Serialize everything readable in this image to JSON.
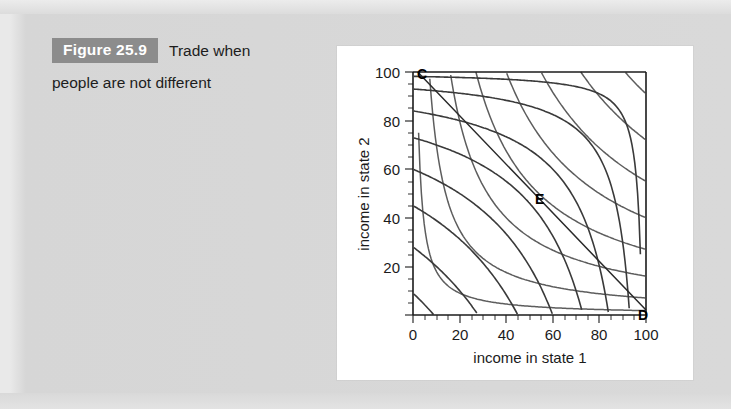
{
  "caption": {
    "figure_badge": "Figure 25.9",
    "title_line1": "Trade when",
    "title_line2": "people are not different",
    "badge_bg": "#8c8c8c",
    "badge_color": "#ffffff"
  },
  "chart_data": {
    "type": "line",
    "title": "",
    "xlabel": "income in state 1",
    "ylabel": "income in state 2",
    "xlim": [
      0,
      105
    ],
    "ylim": [
      0,
      105
    ],
    "xticks": [
      0,
      20,
      40,
      60,
      80,
      100
    ],
    "yticks": [
      20,
      40,
      60,
      80,
      100
    ],
    "xtick_labels": [
      "0",
      "20",
      "40",
      "60",
      "80",
      "100"
    ],
    "ytick_labels": [
      "20",
      "40",
      "60",
      "80",
      "100"
    ],
    "minor_tick_step": 5,
    "grid": false,
    "legend": "none",
    "annotations": [
      {
        "label": "C",
        "x": 2,
        "y": 100,
        "note": "endowment corner top-left"
      },
      {
        "label": "E",
        "x": 50,
        "y": 52,
        "note": "equilibrium / tangency point"
      },
      {
        "label": "D",
        "x": 100,
        "y": 2,
        "note": "endowment corner bottom-right"
      }
    ],
    "series": [
      {
        "name": "person-1 indifference curves",
        "kind": "indifference-family-origin",
        "color": "#5d5d5d",
        "description": "Convex-to-origin curves xy = k, centred on (0,0)",
        "k_values": [
          180,
          700,
          1600,
          2700,
          4000,
          5500,
          7200,
          9100
        ]
      },
      {
        "name": "person-2 indifference curves",
        "kind": "indifference-family-opposite",
        "color": "#3a3a3a",
        "description": "Convex-to-(100,100) curves (100-x)(100-y) = k",
        "k_values": [
          180,
          700,
          1600,
          2700,
          4000,
          5500,
          7200,
          9100
        ]
      },
      {
        "name": "contract / budget line",
        "kind": "straight",
        "color": "#2a2a2a",
        "points": [
          [
            2,
            100
          ],
          [
            50,
            52
          ],
          [
            100,
            2
          ]
        ]
      }
    ]
  }
}
